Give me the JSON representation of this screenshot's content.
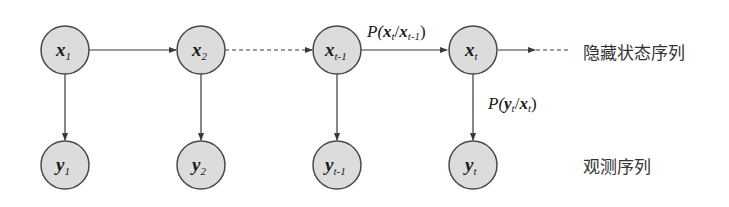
{
  "diagram": {
    "hidden_nodes": [
      {
        "var": "x",
        "sub": "1"
      },
      {
        "var": "x",
        "sub": "2"
      },
      {
        "var": "x",
        "sub": "t-1"
      },
      {
        "var": "x",
        "sub": "t"
      }
    ],
    "observed_nodes": [
      {
        "var": "y",
        "sub": "1"
      },
      {
        "var": "y",
        "sub": "2"
      },
      {
        "var": "y",
        "sub": "t-1"
      },
      {
        "var": "y",
        "sub": "t"
      }
    ],
    "transition_label": {
      "P": "P(",
      "a": "x",
      "a_sub": "t",
      "slash": "/",
      "b": "x",
      "b_sub": "t-1",
      "close": ")"
    },
    "emission_label": {
      "P": "P(",
      "a": "y",
      "a_sub": "t",
      "slash": "/",
      "b": "x",
      "b_sub": "t",
      "close": ")"
    },
    "row_labels": {
      "hidden": "隐藏状态序列",
      "observed": "观测序列"
    },
    "colors": {
      "node_fill": "#dcdcdc",
      "node_stroke": "#4a4a4a",
      "edge": "#3a3a3a"
    }
  }
}
